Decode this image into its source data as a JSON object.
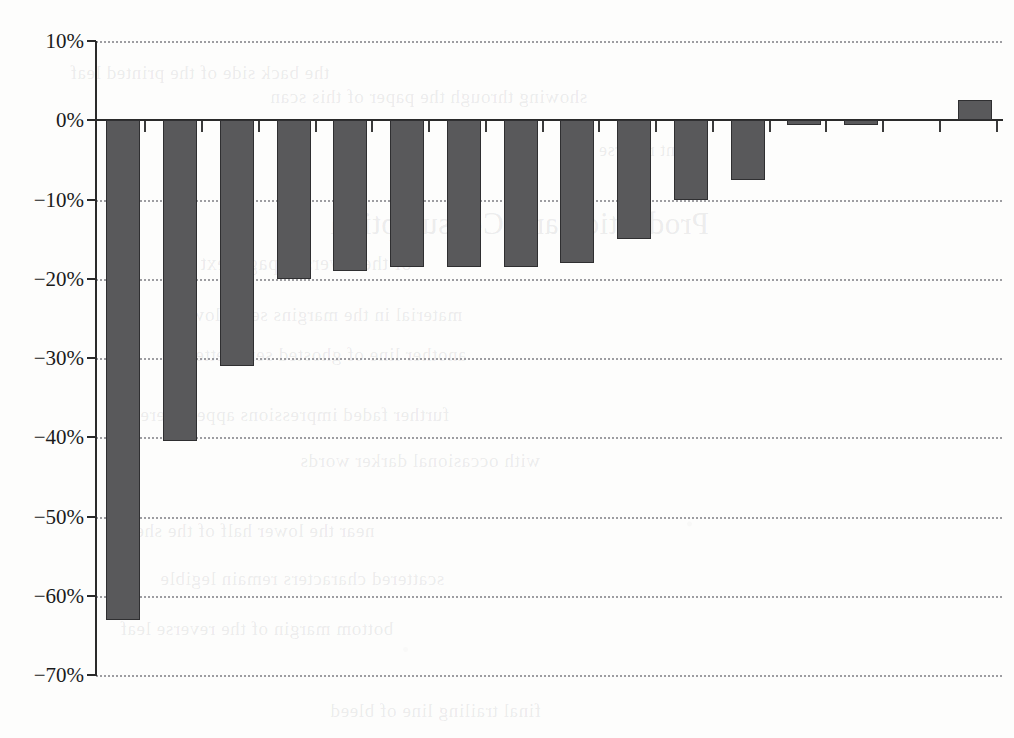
{
  "chart_data": {
    "type": "bar",
    "title": "",
    "subtitle": "",
    "xlabel": "",
    "ylabel": "",
    "ylim": [
      -70,
      10
    ],
    "grid": true,
    "grid_style": "dotted-horizontal",
    "legend": "none",
    "y_tick_labels": [
      "10%",
      "0%",
      "−10%",
      "−20%",
      "−30%",
      "−40%",
      "−50%",
      "−60%",
      "−70%"
    ],
    "y_tick_values": [
      10,
      0,
      -10,
      -20,
      -30,
      -40,
      -50,
      -60,
      -70
    ],
    "x_tick_labels": [
      "",
      "",
      "",
      "",
      "",
      "",
      "",
      "",
      "",
      "",
      "",
      "",
      "",
      "",
      "",
      ""
    ],
    "categories": [
      "1",
      "2",
      "3",
      "4",
      "5",
      "6",
      "7",
      "8",
      "9",
      "10",
      "11",
      "12",
      "13",
      "14",
      "15",
      "16"
    ],
    "values": [
      -63.0,
      -40.5,
      -31.0,
      -20.0,
      -19.0,
      -18.5,
      -18.5,
      -18.5,
      -18.0,
      -15.0,
      -10.0,
      -7.5,
      -0.6,
      -0.6,
      0.0,
      2.5
    ],
    "bar_color": "#59595b",
    "bar_edge_color": "#2f2f31",
    "axis_color": "#2a2a2a",
    "grid_color": "#8d8d92",
    "background_color": "#fdfdfc"
  },
  "bleed_text": {
    "lines": [
      {
        "text": "the back side of the printed leaf",
        "x": 70,
        "y": 62,
        "size": 19
      },
      {
        "text": "showing through the paper of this scan",
        "x": 270,
        "y": 86,
        "size": 19
      },
      {
        "text": "faint reverse type",
        "x": 560,
        "y": 140,
        "size": 18
      },
      {
        "text": "Production and Consumption",
        "x": 330,
        "y": 206,
        "size": 31
      },
      {
        "text": "of the reversed page text",
        "x": 200,
        "y": 252,
        "size": 20
      },
      {
        "text": "material in the margins set below",
        "x": 190,
        "y": 304,
        "size": 19
      },
      {
        "text": "another line of ghosted serif letters",
        "x": 180,
        "y": 344,
        "size": 19
      },
      {
        "text": "further faded impressions appear here",
        "x": 140,
        "y": 404,
        "size": 19
      },
      {
        "text": "with occasional darker words",
        "x": 300,
        "y": 450,
        "size": 19
      },
      {
        "text": "near the lower half of the sheet",
        "x": 120,
        "y": 520,
        "size": 19
      },
      {
        "text": "scattered characters remain legible",
        "x": 160,
        "y": 568,
        "size": 19
      },
      {
        "text": "bottom margin of the reverse leaf",
        "x": 120,
        "y": 618,
        "size": 19
      },
      {
        "text": "final trailing line of bleed",
        "x": 330,
        "y": 700,
        "size": 19
      }
    ]
  }
}
